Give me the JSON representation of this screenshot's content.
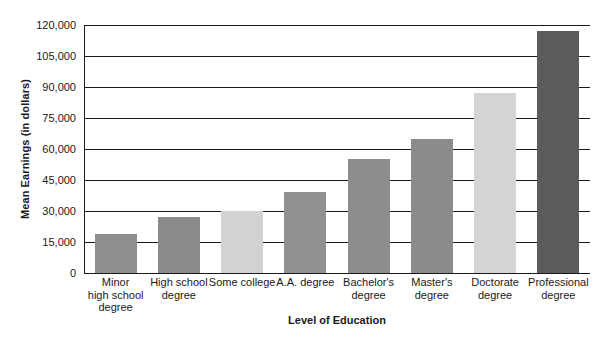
{
  "chart_data": {
    "type": "bar",
    "title": "",
    "xlabel": "Level of Education",
    "ylabel": "Mean Earnings (in dollars)",
    "categories": [
      "Minor high school degree",
      "High school degree",
      "Some college",
      "A.A. degree",
      "Bachelor's degree",
      "Master's degree",
      "Doctorate degree",
      "Professional degree"
    ],
    "category_lines": [
      [
        "Minor",
        "high school",
        "degree"
      ],
      [
        "High school",
        "degree"
      ],
      [
        "Some college"
      ],
      [
        "A.A. degree"
      ],
      [
        "Bachelor's",
        "degree"
      ],
      [
        "Master's",
        "degree"
      ],
      [
        "Doctorate",
        "degree"
      ],
      [
        "Professional",
        "degree"
      ]
    ],
    "values": [
      19000,
      27000,
      30000,
      39000,
      55000,
      65000,
      87000,
      117000
    ],
    "bar_colors": [
      "#8f8f8f",
      "#8a8a8a",
      "#d2d2d2",
      "#909090",
      "#8d8d8d",
      "#8b8b8b",
      "#d4d4d4",
      "#5b5b5b"
    ],
    "ylim": [
      0,
      120000
    ],
    "ytick_values": [
      0,
      15000,
      30000,
      45000,
      60000,
      75000,
      90000,
      105000,
      120000
    ],
    "ytick_labels": [
      "0",
      "15,000",
      "30,000",
      "45,000",
      "60,000",
      "75,000",
      "90,000",
      "105,000",
      "120,000"
    ],
    "grid": true,
    "grid_axis": "y",
    "legend": false,
    "axis_color": "#1a1a1a",
    "background_color": "#ffffff"
  }
}
